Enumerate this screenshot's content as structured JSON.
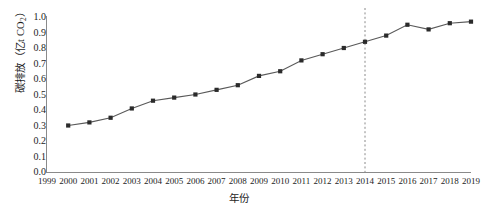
{
  "chart_data": {
    "type": "line",
    "title": "",
    "xlabel": "年份",
    "ylabel_text": "碳排放（亿t CO",
    "ylabel_sub": "2",
    "ylabel_tail": "）",
    "ylabel_full": "碳排放（亿t CO2）",
    "x": [
      2000,
      2001,
      2002,
      2003,
      2004,
      2005,
      2006,
      2007,
      2008,
      2009,
      2010,
      2011,
      2012,
      2013,
      2014,
      2015,
      2016,
      2017,
      2018,
      2019
    ],
    "values": [
      0.3,
      0.32,
      0.35,
      0.41,
      0.46,
      0.48,
      0.5,
      0.53,
      0.56,
      0.62,
      0.65,
      0.72,
      0.76,
      0.8,
      0.84,
      0.88,
      0.95,
      0.92,
      0.96,
      0.97
    ],
    "series": [
      {
        "name": "碳排放",
        "values": [
          0.3,
          0.32,
          0.35,
          0.41,
          0.46,
          0.48,
          0.5,
          0.53,
          0.56,
          0.62,
          0.65,
          0.72,
          0.76,
          0.8,
          0.84,
          0.88,
          0.95,
          0.92,
          0.96,
          0.97
        ]
      }
    ],
    "xlim": [
      1999,
      2019
    ],
    "ylim": [
      0.0,
      1.0
    ],
    "xticks": [
      "1999",
      "2000",
      "2001",
      "2002",
      "2003",
      "2004",
      "2005",
      "2006",
      "2007",
      "2008",
      "2009",
      "2010",
      "2011",
      "2012",
      "2013",
      "2014",
      "2015",
      "2016",
      "2017",
      "2018",
      "2019"
    ],
    "yticks": [
      "1.0",
      "0.9",
      "0.8",
      "0.7",
      "0.6",
      "0.5",
      "0.4",
      "0.3",
      "0.2",
      "0.1",
      "0.0"
    ],
    "grid": false,
    "legend": "none",
    "annotations": [
      {
        "type": "vertical-dashed-line",
        "x": 2014,
        "label": ""
      }
    ],
    "colors": {
      "line": "#595959",
      "marker": "#2b2b2b",
      "axis": "#8a8a8a",
      "dashed_line": "#8a8a8a",
      "text": "#1d1d1d",
      "background": "#ffffff"
    }
  }
}
